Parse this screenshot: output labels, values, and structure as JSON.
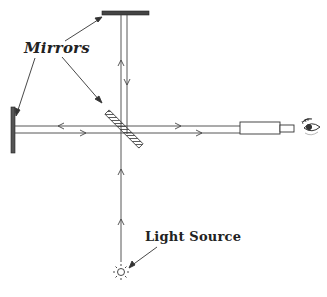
{
  "diagram": {
    "type": "Michelson interferometer",
    "labels": {
      "mirrors": "Mirrors",
      "light_source": "Light Source"
    },
    "components": [
      {
        "name": "top-mirror",
        "kind": "mirror"
      },
      {
        "name": "left-mirror",
        "kind": "mirror"
      },
      {
        "name": "beam-splitter",
        "kind": "half-silvered mirror"
      },
      {
        "name": "telescope",
        "kind": "telescope"
      },
      {
        "name": "eye",
        "kind": "observer"
      },
      {
        "name": "light-source",
        "kind": "lamp"
      }
    ],
    "colors": {
      "line": "#333333",
      "background": "#ffffff"
    }
  }
}
